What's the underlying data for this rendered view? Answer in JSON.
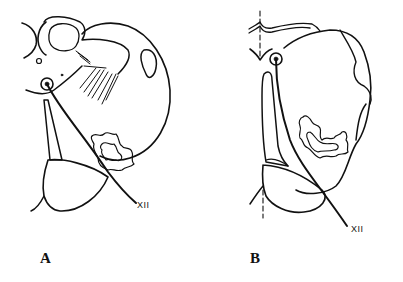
{
  "figure": {
    "panels": [
      {
        "id": "A",
        "label": "A",
        "nerve_label": "XII"
      },
      {
        "id": "B",
        "label": "B",
        "nerve_label": "XII"
      }
    ],
    "colors": {
      "line": "#111111",
      "background": "#ffffff"
    }
  }
}
